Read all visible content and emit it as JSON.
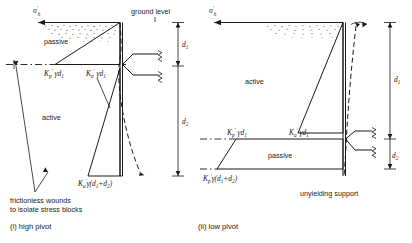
{
  "figure": {
    "title_note": "Earth pressure stress block diagrams for propped retaining wall",
    "panels": [
      {
        "id": "high-pivot",
        "caption": "(i)  high pivot",
        "ground_level_label": "ground level",
        "stress_symbol": "σ",
        "stress_symbol_prime": "′",
        "stress_symbol_sub": "h",
        "zone_labels": {
          "upper": "passive",
          "lower": "active"
        },
        "pressure_labels": [
          {
            "id": "kp-gamma-d1",
            "k": "K",
            "k_sub": "p",
            "k_prime": "′",
            "rest": "γd",
            "rest_sub": "1"
          },
          {
            "id": "ka-gamma-d1",
            "k": "K",
            "k_sub": "a",
            "k_prime": "′",
            "rest": "γd",
            "rest_sub": "1"
          },
          {
            "id": "ka-gamma-d1d2",
            "k": "K",
            "k_sub": "a",
            "k_prime": "′",
            "rest": "γ(d",
            "rest_sub": "1",
            "rest2": "+d",
            "rest2_sub": "2",
            "rest3": ")"
          }
        ],
        "depth_labels": [
          {
            "id": "d1",
            "sym": "d",
            "sub": "1"
          },
          {
            "id": "d2",
            "sym": "d",
            "sub": "2"
          }
        ],
        "note_lines": [
          "frictionless wounds",
          "to isolate stress blocks"
        ]
      },
      {
        "id": "low-pivot",
        "caption": "(ii)  low pivot",
        "support_label": "unyielding support",
        "stress_symbol": "σ",
        "stress_symbol_prime": "′",
        "stress_symbol_sub": "h",
        "zone_labels": {
          "upper": "active",
          "lower": "passive"
        },
        "pressure_labels": [
          {
            "id": "kp-gamma-d1",
            "k": "K",
            "k_sub": "p",
            "k_prime": "′",
            "rest": "γd",
            "rest_sub": "1"
          },
          {
            "id": "ka-gamma-d1",
            "k": "K",
            "k_sub": "a",
            "k_prime": "′",
            "rest": "γd",
            "rest_sub": "1"
          },
          {
            "id": "kp-gamma-d1d2",
            "k": "K",
            "k_sub": "p",
            "k_prime": "′",
            "rest": "γ(d",
            "rest_sub": "1",
            "rest2": "+d",
            "rest2_sub": "2",
            "rest3": ")"
          }
        ],
        "depth_labels": [
          {
            "id": "d1",
            "sym": "d",
            "sub": "1"
          },
          {
            "id": "d2",
            "sym": "d",
            "sub": "2"
          }
        ]
      }
    ],
    "colors": {
      "line": "#1a1a1a",
      "background": "#ffffff",
      "hatch": "#3a3a3a"
    }
  }
}
